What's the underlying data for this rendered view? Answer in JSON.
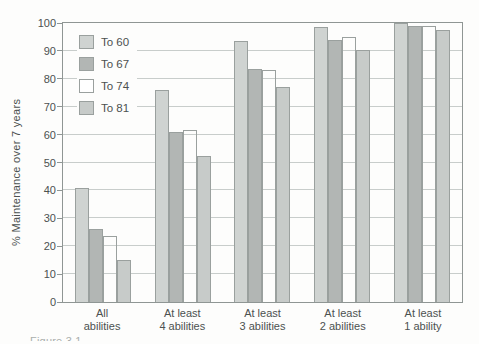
{
  "figure": {
    "bottom_caption_fragment": "Figure 3.1"
  },
  "chart_data": {
    "type": "bar",
    "title": "",
    "xlabel": "",
    "ylabel": "% Maintenance over 7 years",
    "ylim": [
      0,
      100
    ],
    "yticks": [
      0,
      10,
      20,
      30,
      40,
      50,
      60,
      70,
      80,
      90,
      100
    ],
    "grid": "horizontal gridlines every 10 units, full rectangular frame",
    "legend_position": "top-left inside plot area",
    "categories": [
      "All\nabilities",
      "At least\n4 abilities",
      "At least\n3 abilities",
      "At least\n2 abilities",
      "At least\n1 ability"
    ],
    "series": [
      {
        "name": "To 60",
        "color": "#cfd3d1",
        "hollow": false,
        "values": [
          41,
          76,
          93.5,
          98.5,
          100
        ]
      },
      {
        "name": "To 67",
        "color": "#b2b6b4",
        "hollow": false,
        "values": [
          26,
          61,
          83.5,
          94,
          99
        ]
      },
      {
        "name": "To 74",
        "color": "#ffffff",
        "hollow": true,
        "values": [
          23.5,
          61.5,
          83,
          95,
          99
        ]
      },
      {
        "name": "To 81",
        "color": "#c7cbc9",
        "hollow": false,
        "values": [
          15,
          52.5,
          77,
          90.5,
          97.5
        ]
      }
    ],
    "colors": {
      "background": "#fdfdfc",
      "bar_border": "#9aa09e",
      "gridline": "#c8cdcb",
      "axis_frame": "#8f9694",
      "text": "#4c5150"
    }
  }
}
